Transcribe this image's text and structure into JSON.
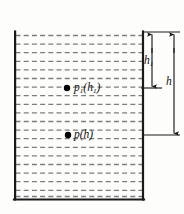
{
  "figure": {
    "colors": {
      "wall": "#1a1a1a",
      "liquid_dash": "#7d7d7d",
      "dimension": "#1a1a1a",
      "point": "#000000",
      "background": "#fdfdfc",
      "text": "#111111"
    },
    "container": {
      "name": "liquid-vessel",
      "left_x": 14,
      "right_x": 143,
      "top_y": 32,
      "bottom_y": 200,
      "wall_thickness": 2.2,
      "open_top": true
    },
    "liquid": {
      "name": "liquid-fill",
      "dash_line_count": 19,
      "first_line_y": 36,
      "line_spacing": 8.6,
      "dash_pattern": "5 3.2",
      "stroke_width": 1.3
    },
    "points": [
      {
        "id": "point-p1",
        "label": "p",
        "sub": "1",
        "arg_open": "(",
        "arg": "h",
        "arg_sub": "1",
        "arg_close": ")",
        "full_label": "p1(h1)",
        "x": 67,
        "y": 88,
        "radius": 3.2
      },
      {
        "id": "point-p",
        "label": "p",
        "sub": "",
        "arg_open": "(",
        "arg": "h",
        "arg_sub": "",
        "arg_close": ")",
        "full_label": "p(h)",
        "x": 68,
        "y": 135,
        "radius": 3.2
      }
    ],
    "dimensions": [
      {
        "id": "dimension-h1",
        "label": "h",
        "sub": "1",
        "full_label": "h1",
        "axis_x": 152,
        "from_y": 32,
        "to_y": 88,
        "arrow_both_ends": true,
        "label_x": 144,
        "label_y": 55
      },
      {
        "id": "dimension-h",
        "label": "h",
        "sub": "",
        "full_label": "h",
        "axis_x": 174,
        "from_y": 32,
        "to_y": 135,
        "arrow_both_ends": true,
        "label_x": 166,
        "label_y": 76
      }
    ],
    "extension_lines": [
      {
        "id": "ext-top",
        "y": 32,
        "x1": 143,
        "x2": 180
      },
      {
        "id": "ext-mid",
        "y": 88,
        "x1": 141,
        "x2": 162
      },
      {
        "id": "ext-bottom",
        "y": 135,
        "x1": 143,
        "x2": 180
      }
    ]
  }
}
